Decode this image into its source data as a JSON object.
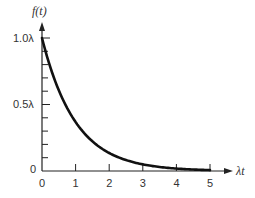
{
  "chart_data": {
    "type": "line",
    "title": "",
    "xlabel": "λt",
    "ylabel": "f(t)",
    "x_ticks": [
      "0",
      "1",
      "2",
      "3",
      "4",
      "5"
    ],
    "y_ticks": [
      "0",
      "0.5λ",
      "1.0λ"
    ],
    "xlim": [
      0,
      5.5
    ],
    "ylim": [
      0,
      1.1
    ],
    "grid": false,
    "legend": null,
    "series": [
      {
        "name": "f(t) = λe^(−λt)",
        "x": [
          0,
          0.25,
          0.5,
          0.75,
          1,
          1.5,
          2,
          2.5,
          3,
          3.5,
          4,
          4.5,
          5
        ],
        "values": [
          1.0,
          0.779,
          0.607,
          0.472,
          0.368,
          0.223,
          0.135,
          0.082,
          0.05,
          0.03,
          0.018,
          0.011,
          0.007
        ]
      }
    ]
  },
  "labels": {
    "y_axis": "f(t)",
    "x_axis": "λt",
    "y_tick_0": "0",
    "y_tick_half": "0.5λ",
    "y_tick_one": "1.0λ",
    "x_ticks": [
      "0",
      "1",
      "2",
      "3",
      "4",
      "5"
    ]
  }
}
